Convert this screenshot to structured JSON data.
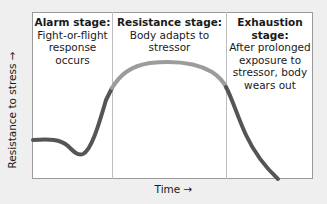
{
  "stages": [
    {
      "title": "Alarm stage:",
      "description": "Fight-or-flight response occurs"
    },
    {
      "title": "Resistance stage:",
      "description": "Body adapts to stressor"
    },
    {
      "title": "Exhaustion stage:",
      "description": "After prolonged exposure to stressor, body wears out"
    }
  ],
  "axes": {
    "y_label": "Resistance to stress →",
    "x_label": "Time →"
  },
  "colors": {
    "background": "#efefef",
    "plot_area": "#ffffff",
    "curve_dark": "#555555",
    "curve_light": "#9c9c9c",
    "divider": "#bdbdbd"
  }
}
